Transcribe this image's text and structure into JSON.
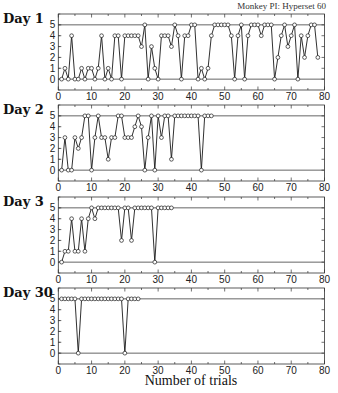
{
  "caption": "Monkey PI: Hyperset 60",
  "chart_data": {
    "type": "line",
    "title": "",
    "subtitle": "Monkey PI: Hyperset 60",
    "xlabel": "Number of trials",
    "ylabel": "",
    "xlim": [
      0,
      80
    ],
    "ylim": [
      -1,
      6
    ],
    "xticks": [
      0,
      10,
      20,
      30,
      40,
      50,
      60,
      70,
      80
    ],
    "yticks": [
      0,
      1,
      2,
      3,
      4,
      5
    ],
    "reference_lines": [
      0,
      5
    ],
    "grid": false,
    "marker": "open-circle",
    "panels": [
      {
        "name": "Day 1",
        "x": [
          1,
          2,
          3,
          4,
          5,
          6,
          7,
          8,
          9,
          10,
          11,
          12,
          13,
          14,
          15,
          16,
          17,
          18,
          19,
          20,
          21,
          22,
          23,
          24,
          25,
          26,
          27,
          28,
          29,
          30,
          31,
          32,
          33,
          34,
          35,
          36,
          37,
          38,
          39,
          40,
          41,
          42,
          43,
          44,
          45,
          46,
          47,
          48,
          49,
          50,
          51,
          52,
          53,
          54,
          55,
          56,
          57,
          58,
          59,
          60,
          61,
          62,
          63,
          64,
          65,
          66,
          67,
          68,
          69,
          70,
          71,
          72,
          73,
          74,
          75,
          76,
          77,
          78
        ],
        "values": [
          0,
          1,
          0,
          4,
          0,
          0,
          1,
          0,
          1,
          1,
          0,
          1,
          4,
          0,
          1,
          0,
          4,
          4,
          0,
          4,
          4,
          4,
          4,
          4,
          3,
          5,
          0,
          3,
          1,
          0,
          4,
          4,
          4,
          3,
          5,
          4,
          0,
          4,
          4,
          5,
          5,
          0,
          1,
          0,
          1,
          4,
          5,
          5,
          5,
          5,
          5,
          4,
          0,
          4,
          5,
          0,
          4,
          5,
          5,
          5,
          4,
          5,
          5,
          5,
          0,
          2,
          4,
          5,
          3,
          4,
          5,
          0,
          4,
          2,
          4,
          5,
          5,
          2
        ]
      },
      {
        "name": "Day 2",
        "x": [
          1,
          2,
          3,
          4,
          5,
          6,
          7,
          8,
          9,
          10,
          11,
          12,
          13,
          14,
          15,
          16,
          17,
          18,
          19,
          20,
          21,
          22,
          23,
          24,
          25,
          26,
          27,
          28,
          29,
          30,
          31,
          32,
          33,
          34,
          35,
          36,
          37,
          38,
          39,
          40,
          41,
          42,
          43,
          44,
          45,
          46
        ],
        "values": [
          0,
          3,
          0,
          0,
          3,
          2,
          3,
          5,
          5,
          0,
          3,
          5,
          3,
          3,
          1,
          3,
          3,
          5,
          5,
          3,
          3,
          3,
          4,
          5,
          4,
          0,
          3,
          5,
          0,
          5,
          3,
          5,
          5,
          1,
          5,
          5,
          5,
          5,
          5,
          5,
          5,
          5,
          0,
          5,
          5,
          5
        ]
      },
      {
        "name": "Day 3",
        "x": [
          1,
          2,
          3,
          4,
          5,
          6,
          7,
          8,
          9,
          10,
          11,
          12,
          13,
          14,
          15,
          16,
          17,
          18,
          19,
          20,
          21,
          22,
          23,
          24,
          25,
          26,
          27,
          28,
          29,
          30,
          31,
          32,
          33,
          34
        ],
        "values": [
          0,
          1,
          1,
          4,
          1,
          1,
          4,
          1,
          4,
          5,
          4,
          5,
          5,
          5,
          5,
          5,
          5,
          5,
          2,
          5,
          5,
          2,
          5,
          5,
          5,
          5,
          5,
          5,
          0,
          5,
          5,
          5,
          5,
          5
        ]
      },
      {
        "name": "Day 30",
        "x": [
          1,
          2,
          3,
          4,
          5,
          6,
          7,
          8,
          9,
          10,
          11,
          12,
          13,
          14,
          15,
          16,
          17,
          18,
          19,
          20,
          21,
          22,
          23,
          24
        ],
        "values": [
          5,
          5,
          5,
          5,
          5,
          0,
          5,
          5,
          5,
          5,
          5,
          5,
          5,
          5,
          5,
          5,
          5,
          5,
          5,
          0,
          5,
          5,
          5,
          5
        ]
      }
    ]
  },
  "colors": {
    "line": "#1a1a1a",
    "frame": "#333333",
    "reference": "#555555",
    "marker_fill": "#ffffff"
  }
}
